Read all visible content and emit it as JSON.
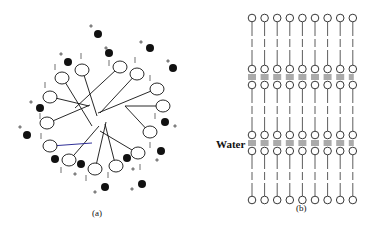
{
  "figure": {
    "panel_a": {
      "label": "(a)",
      "description": "Spherical micelle: surfactant heads (ovals) with hydrocarbon tails pointing to the center, surrounded by counterions (filled circles) and charges",
      "heads": [
        {
          "x": 82,
          "y": 70,
          "tx": 97,
          "ty": 116
        },
        {
          "x": 62,
          "y": 78,
          "tx": 92,
          "ty": 126
        },
        {
          "x": 120,
          "y": 67,
          "tx": 75,
          "ty": 108
        },
        {
          "x": 137,
          "y": 74,
          "tx": 100,
          "ty": 113
        },
        {
          "x": 157,
          "y": 89,
          "tx": 98,
          "ty": 113
        },
        {
          "x": 163,
          "y": 106,
          "tx": 125,
          "ty": 106
        },
        {
          "x": 150,
          "y": 132,
          "tx": 125,
          "ty": 106
        },
        {
          "x": 138,
          "y": 153,
          "tx": 100,
          "ty": 131
        },
        {
          "x": 116,
          "y": 166,
          "tx": 105,
          "ty": 124
        },
        {
          "x": 95,
          "y": 169,
          "tx": 106,
          "ty": 122
        },
        {
          "x": 69,
          "y": 160,
          "tx": 99,
          "ty": 126
        },
        {
          "x": 50,
          "y": 146,
          "tx": 92,
          "ty": 143
        },
        {
          "x": 47,
          "y": 123,
          "tx": 90,
          "ty": 105
        },
        {
          "x": 50,
          "y": 97,
          "tx": 89,
          "ty": 106
        }
      ],
      "counterions": [
        {
          "x": 98,
          "y": 34
        },
        {
          "x": 109,
          "y": 53
        },
        {
          "x": 150,
          "y": 48
        },
        {
          "x": 173,
          "y": 68
        },
        {
          "x": 68,
          "y": 62
        },
        {
          "x": 40,
          "y": 108
        },
        {
          "x": 27,
          "y": 135
        },
        {
          "x": 165,
          "y": 122
        },
        {
          "x": 161,
          "y": 151
        },
        {
          "x": 55,
          "y": 159
        },
        {
          "x": 81,
          "y": 164
        },
        {
          "x": 127,
          "y": 158
        },
        {
          "x": 105,
          "y": 187
        },
        {
          "x": 142,
          "y": 184
        }
      ],
      "plus_signs": [
        {
          "x": 91,
          "y": 26
        },
        {
          "x": 106,
          "y": 48
        },
        {
          "x": 141,
          "y": 42
        },
        {
          "x": 168,
          "y": 61
        },
        {
          "x": 61,
          "y": 54
        },
        {
          "x": 31,
          "y": 102
        },
        {
          "x": 20,
          "y": 127
        },
        {
          "x": 175,
          "y": 126
        },
        {
          "x": 157,
          "y": 160
        },
        {
          "x": 75,
          "y": 174
        },
        {
          "x": 133,
          "y": 169
        },
        {
          "x": 95,
          "y": 192
        },
        {
          "x": 132,
          "y": 189
        }
      ],
      "minus_ticks": [
        {
          "x": 81,
          "y": 56
        },
        {
          "x": 55,
          "y": 67
        },
        {
          "x": 109,
          "y": 63
        },
        {
          "x": 135,
          "y": 60
        },
        {
          "x": 150,
          "y": 78
        },
        {
          "x": 45,
          "y": 85
        },
        {
          "x": 155,
          "y": 116
        },
        {
          "x": 40,
          "y": 116
        },
        {
          "x": 41,
          "y": 136
        },
        {
          "x": 150,
          "y": 145
        },
        {
          "x": 61,
          "y": 170
        },
        {
          "x": 86,
          "y": 178
        },
        {
          "x": 108,
          "y": 175
        },
        {
          "x": 140,
          "y": 167
        }
      ],
      "highlight_tail_color": "#1a1a8c"
    },
    "panel_b": {
      "label": "(b)",
      "water_label": "Water",
      "description": "Lamellar bilayer phase: three layers of molecules with water layers between head-group planes",
      "columns": 9,
      "column_x_start": 252,
      "column_spacing": 12.6,
      "rows": [
        {
          "top_head_y": 18,
          "bottom_head_y": 69
        },
        {
          "top_head_y": 85,
          "bottom_head_y": 135
        },
        {
          "top_head_y": 151,
          "bottom_head_y": 200
        }
      ],
      "water_layers_y": [
        77,
        143
      ]
    }
  }
}
